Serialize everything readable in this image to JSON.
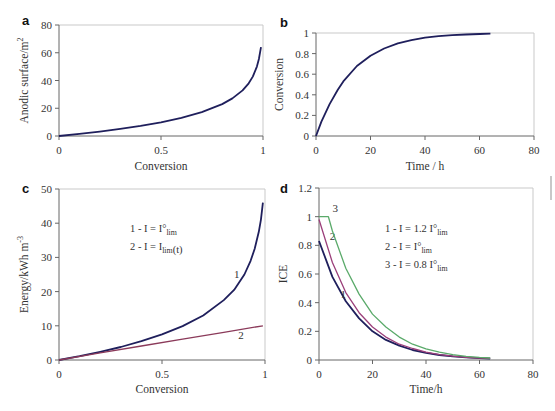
{
  "chart_data": [
    {
      "panel": "a",
      "type": "line",
      "title": "",
      "xlabel": "Conversion",
      "ylabel": "Anodic surface/m^2",
      "xlim": [
        0,
        1
      ],
      "ylim": [
        0,
        80
      ],
      "xticks": [
        "0",
        "0.5",
        "1"
      ],
      "yticks": [
        "0",
        "20",
        "40",
        "60",
        "80"
      ],
      "grid": false,
      "series": [
        {
          "name": "Anodic surface",
          "color": "#1f1f5c",
          "x": [
            0,
            0.1,
            0.2,
            0.3,
            0.4,
            0.5,
            0.6,
            0.7,
            0.8,
            0.85,
            0.9,
            0.93,
            0.95,
            0.97,
            0.98,
            0.99
          ],
          "y": [
            0,
            1.5,
            3.2,
            5.1,
            7.3,
            9.9,
            13.1,
            17.2,
            23.0,
            27.1,
            32.9,
            38.0,
            42.8,
            50.0,
            55.5,
            64.0
          ]
        }
      ]
    },
    {
      "panel": "b",
      "type": "line",
      "title": "",
      "xlabel": "Time / h",
      "ylabel": "Conversion",
      "xlim": [
        0,
        80
      ],
      "ylim": [
        0,
        1
      ],
      "xticks": [
        "0",
        "20",
        "40",
        "60",
        "80"
      ],
      "yticks": [
        "0",
        "0.2",
        "0.4",
        "0.6",
        "0.8",
        "1"
      ],
      "grid": false,
      "series": [
        {
          "name": "Conversion",
          "color": "#1f1f5c",
          "x": [
            0,
            2,
            5,
            8,
            10,
            15,
            20,
            25,
            30,
            35,
            40,
            45,
            50,
            55,
            60,
            64
          ],
          "y": [
            0,
            0.14,
            0.31,
            0.45,
            0.53,
            0.68,
            0.78,
            0.85,
            0.9,
            0.93,
            0.955,
            0.97,
            0.98,
            0.985,
            0.99,
            0.993
          ]
        }
      ]
    },
    {
      "panel": "c",
      "type": "line",
      "title": "",
      "xlabel": "Conversion",
      "ylabel": "Energy/kWh m^-3",
      "xlim": [
        0,
        1
      ],
      "ylim": [
        0,
        50
      ],
      "xticks": [
        "0",
        "0.5",
        "1"
      ],
      "yticks": [
        "0",
        "10",
        "20",
        "30",
        "40",
        "50"
      ],
      "grid": false,
      "legend_text": [
        "1 - I = I°lim",
        "2 - I = Ilim(t)"
      ],
      "series": [
        {
          "name": "1",
          "label_x": 0.85,
          "label_y": 24,
          "color": "#1f1f5c",
          "x": [
            0,
            0.1,
            0.2,
            0.3,
            0.4,
            0.5,
            0.6,
            0.7,
            0.8,
            0.85,
            0.9,
            0.93,
            0.95,
            0.97,
            0.98,
            0.99
          ],
          "y": [
            0,
            1.1,
            2.4,
            3.8,
            5.5,
            7.5,
            9.9,
            13.0,
            17.5,
            20.5,
            25.0,
            29.0,
            32.5,
            37.5,
            41.0,
            46.0
          ]
        },
        {
          "name": "2",
          "label_x": 0.87,
          "label_y": 6,
          "color": "#8b3a5a",
          "x": [
            0,
            0.2,
            0.4,
            0.6,
            0.8,
            0.99
          ],
          "y": [
            0,
            2.1,
            4.1,
            6.1,
            8.1,
            10.0
          ]
        }
      ]
    },
    {
      "panel": "d",
      "type": "line",
      "title": "",
      "xlabel": "Time/h",
      "ylabel": "ICE",
      "xlim": [
        0,
        80
      ],
      "ylim": [
        0,
        1.2
      ],
      "xticks": [
        "0",
        "20",
        "40",
        "60",
        "80"
      ],
      "yticks": [
        "0",
        "0.2",
        "0.4",
        "0.6",
        "0.8",
        "1",
        "1.2"
      ],
      "grid": false,
      "legend_text": [
        "1 - I = 1.2 I°lim",
        "2 - I = I°lim",
        "3 - I = 0.8 I°lim"
      ],
      "series": [
        {
          "name": "1",
          "label_x": 8,
          "label_y": 0.43,
          "color": "#1f1f5c",
          "x": [
            0,
            5,
            10,
            15,
            20,
            25,
            30,
            35,
            40,
            45,
            50,
            55,
            60,
            64
          ],
          "y": [
            0.83,
            0.58,
            0.41,
            0.29,
            0.2,
            0.14,
            0.1,
            0.07,
            0.05,
            0.035,
            0.025,
            0.018,
            0.013,
            0.01
          ]
        },
        {
          "name": "2",
          "label_x": 4,
          "label_y": 0.84,
          "color": "#9b3f7a",
          "x": [
            0,
            5,
            10,
            15,
            20,
            25,
            30,
            35,
            40,
            45,
            50,
            55,
            60,
            64
          ],
          "y": [
            0.98,
            0.68,
            0.47,
            0.33,
            0.23,
            0.16,
            0.11,
            0.08,
            0.055,
            0.038,
            0.027,
            0.019,
            0.014,
            0.011
          ]
        },
        {
          "name": "3",
          "label_x": 5,
          "label_y": 1.03,
          "color": "#5aaa6a",
          "x": [
            0,
            3.5,
            5,
            10,
            15,
            20,
            25,
            30,
            35,
            40,
            45,
            50,
            55,
            60,
            64
          ],
          "y": [
            1.0,
            1.0,
            0.9,
            0.64,
            0.46,
            0.32,
            0.23,
            0.16,
            0.11,
            0.078,
            0.055,
            0.038,
            0.026,
            0.018,
            0.014
          ]
        }
      ]
    }
  ],
  "layout": {
    "panels": [
      {
        "letter": "a",
        "plot": {
          "x0": 59,
          "y0": 25,
          "x1": 263,
          "y1": 136
        },
        "letter_pos": [
          22,
          25
        ],
        "ylabel_x": 28,
        "xlabel_y": 170
      },
      {
        "letter": "b",
        "plot": {
          "x0": 316,
          "y0": 33,
          "x1": 534,
          "y1": 136
        },
        "letter_pos": [
          280,
          27
        ],
        "ylabel_x": 283,
        "xlabel_y": 170
      },
      {
        "letter": "c",
        "plot": {
          "x0": 59,
          "y0": 189,
          "x1": 265,
          "y1": 360
        },
        "letter_pos": [
          22,
          193
        ],
        "ylabel_x": 28,
        "xlabel_y": 393,
        "legend_pos": [
          130,
          232
        ]
      },
      {
        "letter": "d",
        "plot": {
          "x0": 319,
          "y0": 188,
          "x1": 533,
          "y1": 360
        },
        "letter_pos": [
          280,
          193
        ],
        "ylabel_x": 287,
        "xlabel_y": 393,
        "legend_pos": [
          385,
          232
        ]
      }
    ]
  }
}
